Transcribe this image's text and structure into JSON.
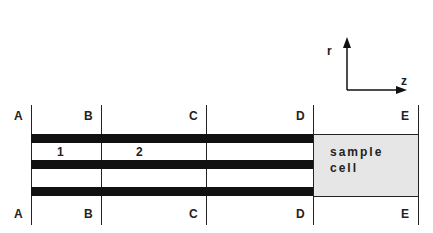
{
  "diagram": {
    "sections": [
      {
        "label": "A",
        "x": 31
      },
      {
        "label": "B",
        "x": 101
      },
      {
        "label": "C",
        "x": 206
      },
      {
        "label": "D",
        "x": 313
      },
      {
        "label": "E",
        "x": 418
      }
    ],
    "regions": [
      {
        "label": "1"
      },
      {
        "label": "2"
      }
    ],
    "sample_cell": {
      "line1": "sample",
      "line2": "cell"
    },
    "axes": {
      "vertical_label": "r",
      "horizontal_label": "z"
    }
  }
}
